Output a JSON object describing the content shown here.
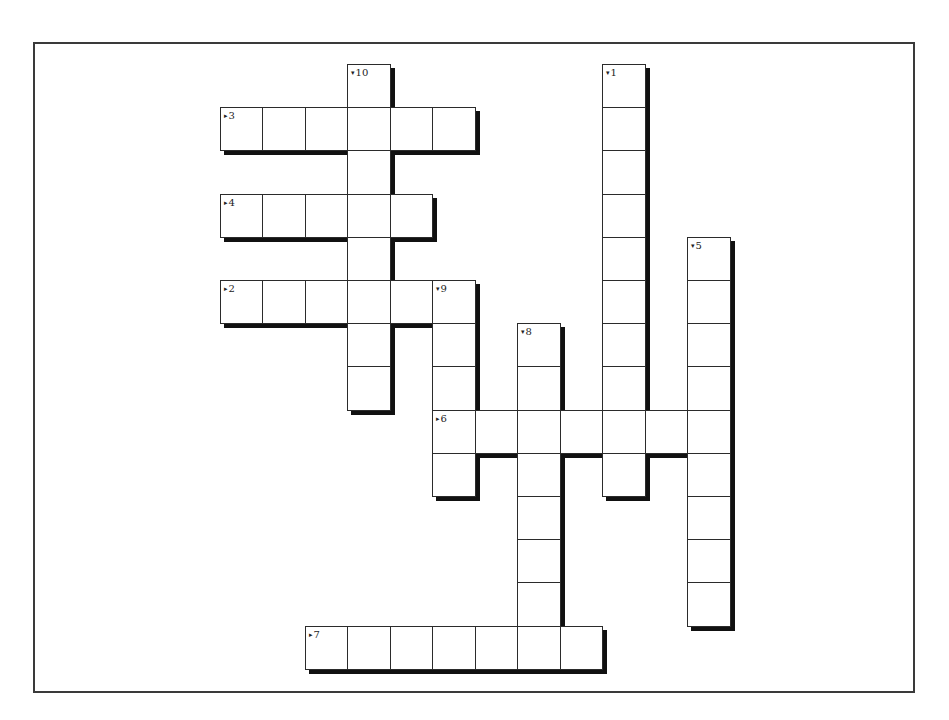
{
  "puzzle": {
    "grid": {
      "x0": 219.5,
      "y0": 64,
      "cell_w": 42.5,
      "cell_h": 43.2,
      "shadow_offset": 4
    },
    "colors": {
      "border": "#2b2b2b",
      "shadow": "#111111",
      "frame": "#3a3a3a",
      "background": "#ffffff"
    },
    "entries": [
      {
        "number": "1",
        "direction": "down",
        "row": 0,
        "col": 9,
        "length": 10
      },
      {
        "number": "2",
        "direction": "across",
        "row": 5,
        "col": 0,
        "length": 6
      },
      {
        "number": "3",
        "direction": "across",
        "row": 1,
        "col": 0,
        "length": 6
      },
      {
        "number": "4",
        "direction": "across",
        "row": 3,
        "col": 0,
        "length": 5
      },
      {
        "number": "5",
        "direction": "down",
        "row": 4,
        "col": 11,
        "length": 9
      },
      {
        "number": "6",
        "direction": "across",
        "row": 8,
        "col": 5,
        "length": 7
      },
      {
        "number": "7",
        "direction": "across",
        "row": 13,
        "col": 2,
        "length": 7
      },
      {
        "number": "8",
        "direction": "down",
        "row": 6,
        "col": 7,
        "length": 8
      },
      {
        "number": "9",
        "direction": "down",
        "row": 5,
        "col": 5,
        "length": 5
      },
      {
        "number": "10",
        "direction": "down",
        "row": 0,
        "col": 3,
        "length": 8
      }
    ],
    "glyphs": {
      "across-arrow-icon": "▸",
      "down-arrow-icon": "▾"
    }
  }
}
